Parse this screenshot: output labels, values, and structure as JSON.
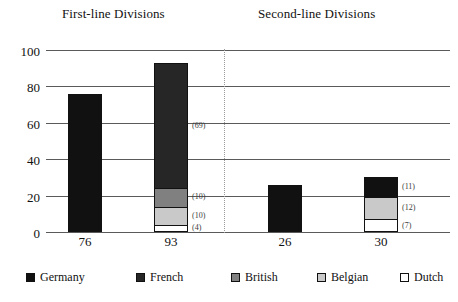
{
  "chart_data": {
    "type": "bar",
    "subtype": "stacked",
    "title": "",
    "xlabel": "",
    "ylabel": "",
    "ylim": [
      0,
      100
    ],
    "yticks": [
      0,
      20,
      40,
      60,
      80,
      100
    ],
    "grid": true,
    "legend_position": "bottom",
    "group_headings": [
      {
        "label": "First-line Divisions",
        "left_px": 62
      },
      {
        "label": "Second-line Divisions",
        "left_px": 258
      }
    ],
    "divider": {
      "style": "dotted",
      "between": [
        "First-line Divisions",
        "Second-line Divisions"
      ]
    },
    "categories": [
      "76",
      "93",
      "26",
      "30"
    ],
    "series": [
      {
        "name": "Germany",
        "color": "#111111",
        "values": [
          76,
          0,
          26,
          11
        ]
      },
      {
        "name": "French",
        "color": "#262626",
        "values": [
          0,
          69,
          0,
          0
        ]
      },
      {
        "name": "British",
        "color": "#808080",
        "values": [
          0,
          10,
          0,
          0
        ]
      },
      {
        "name": "Belgian",
        "color": "#c9c9c9",
        "values": [
          0,
          10,
          0,
          12
        ]
      },
      {
        "name": "Dutch",
        "color": "#ffffff",
        "values": [
          0,
          4,
          0,
          7
        ]
      }
    ],
    "bars": [
      {
        "category": "76",
        "group": "First-line Divisions",
        "total": 76,
        "left_px": 22,
        "segments": [
          {
            "series": "Germany",
            "value": 76,
            "color": "#111111",
            "label": ""
          }
        ]
      },
      {
        "category": "93",
        "group": "First-line Divisions",
        "total": 93,
        "left_px": 108,
        "segments": [
          {
            "series": "Dutch",
            "value": 4,
            "color": "#ffffff",
            "label": "(4)"
          },
          {
            "series": "Belgian",
            "value": 10,
            "color": "#c9c9c9",
            "label": "(10)"
          },
          {
            "series": "British",
            "value": 10,
            "color": "#808080",
            "label": "(10)"
          },
          {
            "series": "French",
            "value": 69,
            "color": "#262626",
            "label": "(69)"
          }
        ]
      },
      {
        "category": "26",
        "group": "Second-line Divisions",
        "total": 26,
        "left_px": 222,
        "segments": [
          {
            "series": "Germany",
            "value": 26,
            "color": "#111111",
            "label": ""
          }
        ]
      },
      {
        "category": "30",
        "group": "Second-line Divisions",
        "total": 30,
        "left_px": 318,
        "segments": [
          {
            "series": "Dutch",
            "value": 7,
            "color": "#ffffff",
            "label": "(7)"
          },
          {
            "series": "Belgian",
            "value": 12,
            "color": "#c9c9c9",
            "label": "(12)"
          },
          {
            "series": "Germany",
            "value": 11,
            "color": "#111111",
            "label": "(11)"
          }
        ]
      }
    ],
    "legend": [
      {
        "label": "Germany",
        "color": "#111111",
        "left_px": 26
      },
      {
        "label": "French",
        "color": "#262626",
        "left_px": 136
      },
      {
        "label": "British",
        "color": "#808080",
        "left_px": 231
      },
      {
        "label": "Belgian",
        "color": "#c9c9c9",
        "left_px": 317
      },
      {
        "label": "Dutch",
        "color": "#ffffff",
        "left_px": 400
      }
    ]
  }
}
